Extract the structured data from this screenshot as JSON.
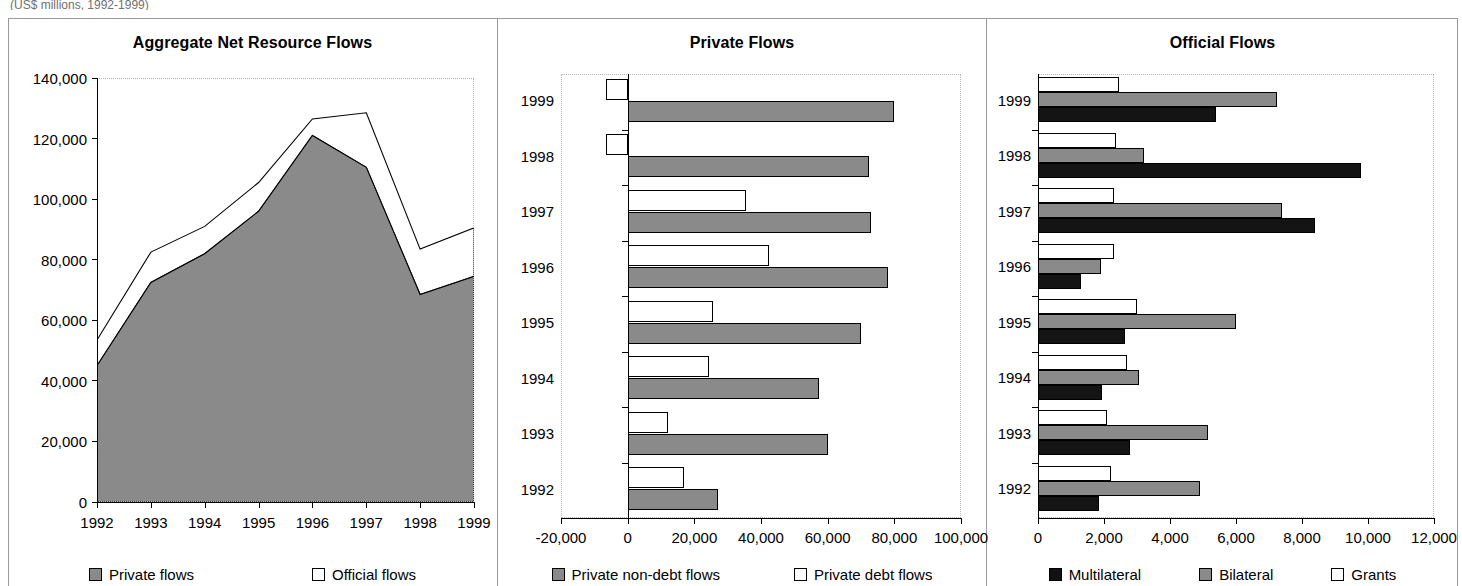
{
  "figure": {
    "clipped_header_text": "(US$ millions, 1992-1999)"
  },
  "colors": {
    "private_gray": "#8a8a8a",
    "official_white": "#ffffff",
    "multilateral_black": "#141414",
    "axis": "#000000",
    "frame": "#9a9a9a"
  },
  "panels": [
    {
      "title": "Aggregate Net Resource Flows",
      "legend": [
        {
          "label": "Private flows",
          "swatch": "gray"
        },
        {
          "label": "Official flows",
          "swatch": "white"
        }
      ]
    },
    {
      "title": "Private Flows",
      "legend": [
        {
          "label": "Private non-debt flows",
          "swatch": "gray"
        },
        {
          "label": "Private debt flows",
          "swatch": "white"
        }
      ]
    },
    {
      "title": "Official Flows",
      "legend": [
        {
          "label": "Multilateral",
          "swatch": "black"
        },
        {
          "label": "Bilateral",
          "swatch": "gray"
        },
        {
          "label": "Grants",
          "swatch": "white"
        }
      ]
    }
  ],
  "chart_data": [
    {
      "type": "area",
      "title": "Aggregate Net Resource Flows",
      "xlabel": "",
      "ylabel": "",
      "categories": [
        "1992",
        "1993",
        "1994",
        "1995",
        "1996",
        "1997",
        "1998",
        "1999"
      ],
      "x_tick_labels": [
        "1992",
        "1993",
        "1994",
        "1995",
        "1996",
        "1997",
        "1998",
        "1999"
      ],
      "y_tick_labels": [
        "0",
        "20,000",
        "40,000",
        "60,000",
        "80,000",
        "100,000",
        "120,000",
        "140,000"
      ],
      "y_ticks": [
        0,
        20000,
        40000,
        60000,
        80000,
        100000,
        120000,
        140000
      ],
      "ylim": [
        0,
        140000
      ],
      "grid": false,
      "stacked": true,
      "legend_position": "bottom",
      "series": [
        {
          "name": "Private flows",
          "values": [
            45000,
            72500,
            82000,
            96000,
            121000,
            110500,
            68500,
            74500
          ]
        },
        {
          "name": "Official flows",
          "values": [
            8500,
            10000,
            9000,
            9500,
            5500,
            18000,
            15000,
            16000
          ]
        }
      ],
      "totals": [
        53500,
        82500,
        91000,
        105500,
        126500,
        128500,
        83500,
        90500
      ]
    },
    {
      "type": "bar",
      "orientation": "horizontal",
      "title": "Private Flows",
      "xlabel": "",
      "ylabel": "",
      "categories": [
        "1999",
        "1998",
        "1997",
        "1996",
        "1995",
        "1994",
        "1993",
        "1992"
      ],
      "x_tick_labels": [
        "-20,000",
        "0",
        "20,000",
        "40,000",
        "60,000",
        "80,000",
        "100,000"
      ],
      "x_ticks": [
        -20000,
        0,
        20000,
        40000,
        60000,
        80000,
        100000
      ],
      "xlim": [
        -20000,
        100000
      ],
      "grid": false,
      "legend_position": "bottom",
      "series": [
        {
          "name": "Private non-debt flows",
          "values": [
            80000,
            72500,
            73000,
            78000,
            70000,
            57500,
            60000,
            27000
          ]
        },
        {
          "name": "Private debt flows",
          "values": [
            -6500,
            -6500,
            35500,
            42500,
            25500,
            24500,
            12000,
            17000
          ]
        }
      ]
    },
    {
      "type": "bar",
      "orientation": "horizontal",
      "title": "Official Flows",
      "xlabel": "",
      "ylabel": "",
      "categories": [
        "1999",
        "1998",
        "1997",
        "1996",
        "1995",
        "1994",
        "1993",
        "1992"
      ],
      "x_tick_labels": [
        "0",
        "2,000",
        "4,000",
        "6,000",
        "8,000",
        "10,000",
        "12,000"
      ],
      "x_ticks": [
        0,
        2000,
        4000,
        6000,
        8000,
        10000,
        12000
      ],
      "xlim": [
        0,
        12000
      ],
      "grid": false,
      "legend_position": "bottom",
      "series": [
        {
          "name": "Multilateral",
          "values": [
            5400,
            9800,
            8400,
            1300,
            2650,
            1950,
            2800,
            1850
          ]
        },
        {
          "name": "Bilateral",
          "values": [
            7250,
            3200,
            7400,
            1900,
            6000,
            3050,
            5150,
            4900
          ]
        },
        {
          "name": "Grants",
          "values": [
            2450,
            2350,
            2300,
            2300,
            3000,
            2700,
            2100,
            2200
          ]
        }
      ]
    }
  ]
}
